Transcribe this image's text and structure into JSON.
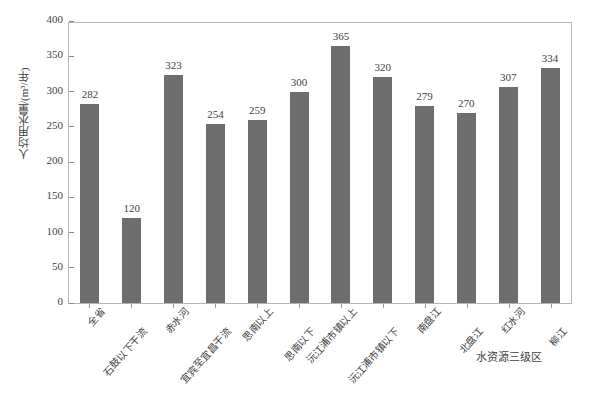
{
  "chart_data": {
    "type": "bar",
    "title": "",
    "xlabel": "水资源三级区",
    "ylabel": "人均用水量/(m³/年)",
    "ylim": [
      0,
      400
    ],
    "yticks": [
      0,
      50,
      100,
      150,
      200,
      250,
      300,
      350,
      400
    ],
    "grid": false,
    "legend": null,
    "bar_color": "#6e6e6e",
    "categories": [
      "全省",
      "石鼓以下干流",
      "赤水河",
      "宜宾至宜昌干流",
      "思南以上",
      "思南以下",
      "沅江浦市镇以上",
      "沅江浦市镇以下",
      "南盘江",
      "北盘江",
      "红水河",
      "柳江"
    ],
    "values": [
      282,
      120,
      323,
      254,
      259,
      300,
      365,
      320,
      279,
      270,
      307,
      334
    ],
    "value_labels": [
      "282",
      "120",
      "323",
      "254",
      "259",
      "300",
      "365",
      "320",
      "279",
      "270",
      "307",
      "334"
    ],
    "ytick_labels": [
      "0",
      "50",
      "100",
      "150",
      "200",
      "250",
      "300",
      "350",
      "400"
    ]
  }
}
